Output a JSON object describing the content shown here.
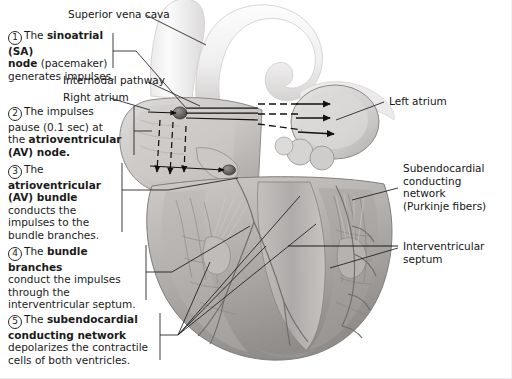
{
  "figure": {
    "colors": {
      "ink": "#161616",
      "leader": "#2b2b2b",
      "muscle_mid": "#b9b6b4",
      "muscle_dark": "#8d8a88",
      "vessel_pale": "#f2f2f3",
      "chamber_light": "#d9d7d6"
    }
  },
  "labels": [
    {
      "id": "superior-vena-cava",
      "text": "Superior vena cava"
    },
    {
      "id": "internodal-pathway",
      "text": "Internodal pathway"
    },
    {
      "id": "right-atrium",
      "text": "Right atrium"
    },
    {
      "id": "left-atrium",
      "text": "Left atrium"
    },
    {
      "id": "interventricular-septum",
      "text": "Interventricular\nseptum"
    }
  ],
  "label_text": {
    "superior_vena_cava": "Superior vena cava",
    "internodal_pathway": "Internodal pathway",
    "right_atrium": "Right atrium",
    "left_atrium": "Left atrium",
    "subendocardial_l1": "Subendocardial",
    "subendocardial_l2": "conducting network",
    "subendocardial_l3": "(Purkinje fibers)",
    "interventricular_l1": "Interventricular",
    "interventricular_l2": "septum"
  },
  "callouts": [
    {
      "number": "1",
      "plain_1": "The ",
      "bold_1": "sinoatrial (SA)",
      "bold_2": "node",
      "plain_2": " (pacemaker)",
      "plain_3": "generates impulses."
    },
    {
      "number": "2",
      "plain_1": "The impulses",
      "plain_2": "pause (0.1 sec) at",
      "plain_3": "the ",
      "bold_1": "atrioventricular",
      "bold_2": "(AV) node."
    },
    {
      "number": "3",
      "plain_1": "The",
      "bold_1": "atrioventricular",
      "bold_2": "(AV) bundle",
      "plain_2": "conducts the",
      "plain_3": "impulses to the",
      "plain_4": "bundle branches."
    },
    {
      "number": "4",
      "plain_1": "The ",
      "bold_1": "bundle branches",
      "plain_2": "conduct the impulses",
      "plain_3": "through the",
      "plain_4": "interventricular septum."
    },
    {
      "number": "5",
      "plain_1": "The ",
      "bold_1": "subendocardial",
      "bold_2": "conducting network",
      "plain_2": "depolarizes the contractile",
      "plain_3": "cells of both ventricles."
    }
  ],
  "anatomy": {
    "sa_node": "sinoatrial-node",
    "av_node": "atrioventricular-node",
    "av_bundle": "atrioventricular-bundle",
    "bundle_branches": "bundle-branches",
    "purkinje": "purkinje-fiber-network",
    "aorta": "aortic-arch",
    "pulmonary_trunk": "pulmonary-trunk",
    "svc": "superior-vena-cava-vessel"
  },
  "arrows": {
    "internodal_solid_count": "3",
    "interatrial_dashed_count": "3",
    "left_atrium_solid_count": "3",
    "descending_dashed_count": "3"
  }
}
